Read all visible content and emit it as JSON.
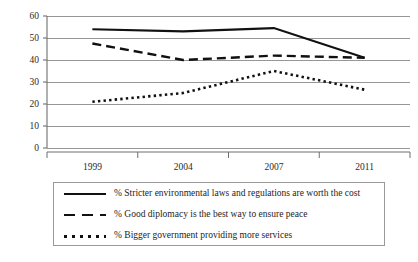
{
  "chart_data": {
    "type": "line",
    "title": "",
    "xlabel": "",
    "ylabel": "",
    "categories": [
      "1999",
      "2004",
      "2007",
      "2011"
    ],
    "ylim": [
      0,
      60
    ],
    "yticks": [
      0,
      10,
      20,
      30,
      40,
      50,
      60
    ],
    "grid": true,
    "legend_position": "bottom",
    "series": [
      {
        "name": "% Stricter environmental laws and regulations are worth the cost",
        "style": "solid",
        "color": "#111111",
        "values": [
          54,
          53,
          54.5,
          41
        ]
      },
      {
        "name": "% Good diplomacy is the best way to ensure peace",
        "style": "dashed",
        "color": "#111111",
        "values": [
          47.5,
          40,
          42,
          41
        ]
      },
      {
        "name": "% Bigger government providing more services",
        "style": "dotted",
        "color": "#111111",
        "values": [
          21,
          25,
          35,
          26.5
        ]
      }
    ]
  },
  "axis": {
    "ytick_labels": [
      "60",
      "50",
      "40",
      "30",
      "20",
      "10",
      "0"
    ],
    "xtick_labels": [
      "1999",
      "2004",
      "2007",
      "2011"
    ]
  },
  "legend": {
    "items": [
      {
        "key": "solid-line-key",
        "label": "% Stricter environmental laws and regulations are worth the cost"
      },
      {
        "key": "dashed-line-key",
        "label": "% Good diplomacy is the best way to ensure peace"
      },
      {
        "key": "dotted-line-key",
        "label": "% Bigger government providing more services"
      }
    ]
  }
}
